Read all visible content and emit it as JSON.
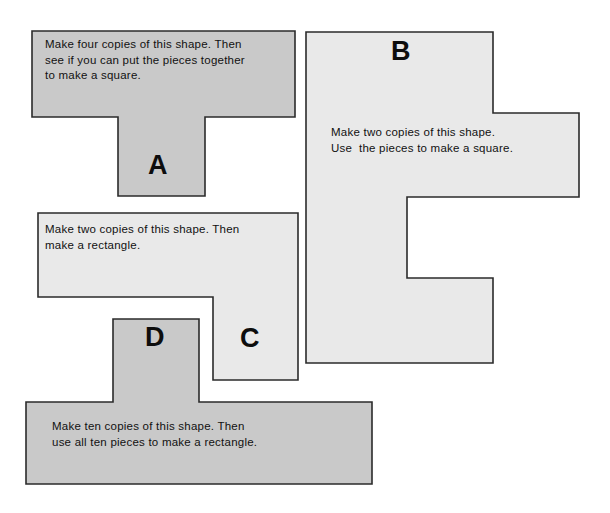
{
  "page": {
    "background_color": "#ffffff",
    "width": 610,
    "height": 513
  },
  "palette": {
    "fill_dark_gray": "#c9c9c9",
    "fill_light_gray": "#e9e9e9",
    "outline": "#2b2b2b",
    "text": "#111111"
  },
  "shapes": [
    {
      "id": "a",
      "letter": "A",
      "fill": "#c9c9c9",
      "form": "T-shape",
      "instruction_line1": "Make four copies of this shape. Then",
      "instruction_line2": "see if you can put the pieces together",
      "instruction_line3": "to make a square.",
      "points": "32,31 295,31 295,117 205,117 205,196 118,196 118,117 32,117"
    },
    {
      "id": "b",
      "letter": "B",
      "fill": "#e9e9e9",
      "form": "stepped-C-shape",
      "instruction_line1": "Make two copies of this shape.",
      "instruction_line2": "Use  the pieces to make a square.",
      "points": "306,32 493,32 493,113 579,113 579,197 407,197 407,278 493,278 493,363 306,363"
    },
    {
      "id": "c",
      "letter": "C",
      "fill": "#e9e9e9",
      "form": "L-shape",
      "instruction_line1": "Make two copies of this shape. Then",
      "instruction_line2": "make a rectangle.",
      "points": "38,213 298,213 298,380 213,380 213,297 38,297"
    },
    {
      "id": "d",
      "letter": "D",
      "fill": "#c9c9c9",
      "form": "inverted-T-shape",
      "instruction_line1": "Make ten copies of this shape. Then",
      "instruction_line2": "use all ten pieces to make a rectangle.",
      "points": "113,319 199,319 199,402 372,402 372,484 26,484 26,402 113,402"
    }
  ]
}
